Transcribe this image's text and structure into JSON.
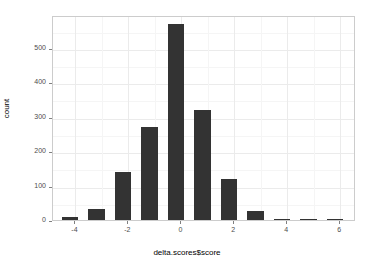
{
  "chart_data": {
    "type": "bar",
    "title": "",
    "subtitle": "",
    "xlabel": "delta.scores$score",
    "ylabel": "count",
    "categories": [
      -4.2,
      -3.2,
      -2.2,
      -1.2,
      -0.2,
      0.8,
      1.8,
      2.8,
      3.8,
      4.8,
      5.8
    ],
    "values": [
      10,
      32,
      140,
      270,
      570,
      320,
      120,
      25,
      2,
      3,
      1
    ],
    "xlim": [
      -4.85,
      6.6
    ],
    "ylim": [
      0,
      595
    ],
    "xticks": [
      -4,
      -2,
      0,
      2,
      4,
      6
    ],
    "xtick_labels": [
      "-4",
      "-2",
      "0",
      "2",
      "4",
      "6"
    ],
    "yticks": [
      0,
      100,
      200,
      300,
      400,
      500
    ],
    "ytick_labels": [
      "0",
      "100",
      "200",
      "300",
      "400",
      "500"
    ],
    "x_minor_ticks": [
      -5,
      -3,
      -1,
      1,
      3,
      5
    ],
    "y_minor_ticks": [
      50,
      150,
      250,
      350,
      450,
      550
    ],
    "bar_width": 0.62,
    "grid": true,
    "legend": false,
    "legend_position": "none",
    "colors": {
      "bar_fill": "#333333",
      "panel_background": "#ffffff",
      "panel_border": "#cccccc",
      "grid_major": "#ebebeb",
      "grid_minor": "#f5f5f5",
      "axis_text": "#4d4d4d",
      "axis_title": "#000000"
    }
  }
}
